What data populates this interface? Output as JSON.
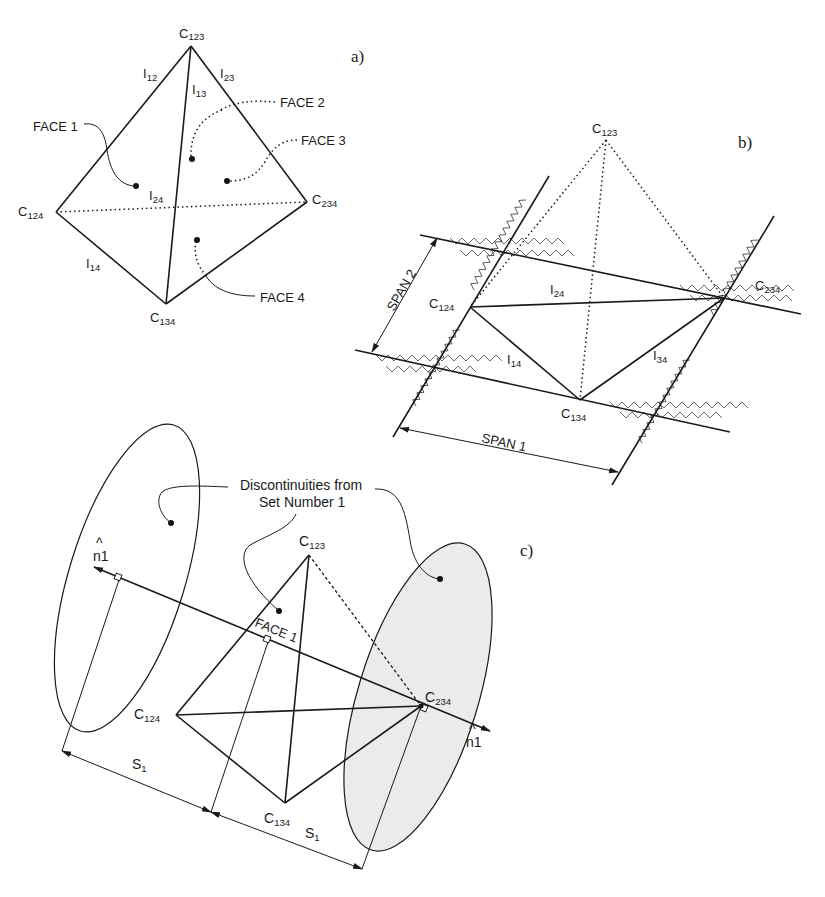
{
  "figure": {
    "panels": [
      {
        "id": "a",
        "label": "a)",
        "vertices": {
          "C123": "C",
          "C124": "C",
          "C234": "C",
          "C134": "C"
        },
        "vertex_labels": {
          "c123": {
            "base": "C",
            "sub": "123"
          },
          "c124": {
            "base": "C",
            "sub": "124"
          },
          "c234": {
            "base": "C",
            "sub": "234"
          },
          "c134": {
            "base": "C",
            "sub": "134"
          }
        },
        "edge_labels": {
          "i12": {
            "base": "I",
            "sub": "12"
          },
          "i23": {
            "base": "I",
            "sub": "23"
          },
          "i13": {
            "base": "I",
            "sub": "13"
          },
          "i24": {
            "base": "I",
            "sub": "24"
          },
          "i14": {
            "base": "I",
            "sub": "14"
          }
        },
        "face_labels": {
          "face1": "FACE 1",
          "face2": "FACE 2",
          "face3": "FACE 3",
          "face4": "FACE 4"
        }
      },
      {
        "id": "b",
        "label": "b)",
        "vertex_labels": {
          "c123": {
            "base": "C",
            "sub": "123"
          },
          "c124": {
            "base": "C",
            "sub": "124"
          },
          "c234": {
            "base": "C",
            "sub": "234"
          },
          "c134": {
            "base": "C",
            "sub": "134"
          }
        },
        "edge_labels": {
          "i24": {
            "base": "I",
            "sub": "24"
          },
          "i14": {
            "base": "I",
            "sub": "14"
          },
          "i34": {
            "base": "I",
            "sub": "34"
          }
        },
        "dimensions": {
          "span1": "SPAN 1",
          "span2": "SPAN 2"
        }
      },
      {
        "id": "c",
        "label": "c)",
        "callout": {
          "line1": "Discontinuities from",
          "line2": "Set Number 1"
        },
        "vertex_labels": {
          "c123": {
            "base": "C",
            "sub": "123"
          },
          "c124": {
            "base": "C",
            "sub": "124"
          },
          "c234": {
            "base": "C",
            "sub": "234"
          },
          "c134": {
            "base": "C",
            "sub": "134"
          }
        },
        "face_label": "FACE 1",
        "normal_label": {
          "base": "n",
          "hat": "^",
          "suffix": "1"
        },
        "spacing_label": {
          "base": "S",
          "sub": "1"
        }
      }
    ]
  }
}
